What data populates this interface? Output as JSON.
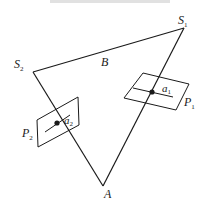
{
  "diagram": {
    "title": "",
    "colors": {
      "stroke": "#1a1a1a",
      "background": "#ffffff"
    },
    "vertices": {
      "S1": {
        "label": "S",
        "sub": "1",
        "x": 184,
        "y": 28
      },
      "S2": {
        "label": "S",
        "sub": "2",
        "x": 33,
        "y": 72
      },
      "A": {
        "label": "A",
        "sub": "",
        "x": 103,
        "y": 186
      }
    },
    "labels": {
      "B": "B",
      "a1": {
        "label": "a",
        "sub": "1"
      },
      "a2": {
        "label": "a",
        "sub": "2"
      },
      "P1": {
        "label": "P",
        "sub": "1"
      },
      "P2": {
        "label": "P",
        "sub": "2"
      }
    },
    "planes": {
      "P1": {
        "corners": [
          [
            143,
            73
          ],
          [
            189,
            84
          ],
          [
            176,
            110
          ],
          [
            124,
            98
          ]
        ]
      },
      "P2": {
        "corners": [
          [
            37,
            120
          ],
          [
            78,
            97
          ],
          [
            79,
            125
          ],
          [
            38,
            147
          ]
        ]
      }
    },
    "points": {
      "a1": {
        "x": 152,
        "y": 92
      },
      "a2": {
        "x": 57,
        "y": 123
      }
    }
  }
}
